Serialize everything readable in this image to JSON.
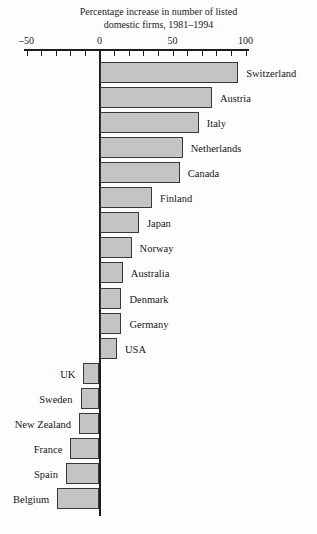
{
  "title": {
    "line1": "Percentage increase in number of listed",
    "line2": "domestic firms, 1981–1994"
  },
  "chart_data": {
    "type": "bar",
    "orientation": "horizontal",
    "title": "Percentage increase in number of listed domestic firms, 1981–1994",
    "categories": [
      "Switzerland",
      "Austria",
      "Italy",
      "Netherlands",
      "Canada",
      "Finland",
      "Japan",
      "Norway",
      "Australia",
      "Denmark",
      "Germany",
      "USA",
      "UK",
      "Sweden",
      "New Zealand",
      "France",
      "Spain",
      "Belgium"
    ],
    "values": [
      95,
      77,
      68,
      57,
      55,
      36,
      27,
      22,
      16,
      15,
      15,
      12,
      -11,
      -13,
      -14,
      -20,
      -23,
      -29
    ],
    "xlabel": "",
    "ylabel": "",
    "xlim": [
      -50,
      100
    ],
    "x_tick_step": 10,
    "x_tick_labels": [
      {
        "value": -50,
        "label": "–50"
      },
      {
        "value": 0,
        "label": "0"
      },
      {
        "value": 50,
        "label": "50"
      },
      {
        "value": 100,
        "label": "100"
      }
    ],
    "grid": false,
    "legend": false,
    "bar_fill_color": "#c3c5c3",
    "bar_border_color": "#383838",
    "axis_color": "#1c1c1c"
  }
}
